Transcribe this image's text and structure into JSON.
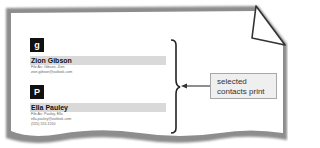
{
  "contacts": [
    {
      "initial": "g",
      "name": "Zion Gibson",
      "file_as_label": "File As:",
      "file_as_value": "Gibson, Zion",
      "email": "zion.gibson@outlook.com"
    },
    {
      "initial": "P",
      "name": "Ella Pauley",
      "file_as_label": "File As:",
      "file_as_value": "Pauley, Ella",
      "email": "ella.pauley@outlook.com",
      "phone": "(555) 555-1550"
    }
  ],
  "callout": {
    "line1": "selected",
    "line2": "contacts print"
  },
  "colors": {
    "paper_border": "#9a9a9a",
    "name_bar": "#d9d9d9",
    "initial_bg": "#111111",
    "callout_bg": "#efefef",
    "callout_border": "#a8a8a8"
  }
}
